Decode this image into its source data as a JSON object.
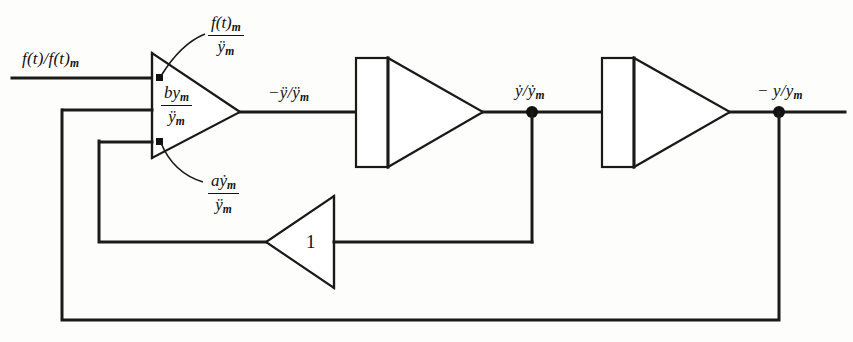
{
  "figure": {
    "type": "analog-computer-block-diagram",
    "stroke_color": "#1a1a1a",
    "background_color": "#fdfdfb"
  },
  "signals": {
    "input": "f(t)/f(t)",
    "input_sub": "m",
    "after_summer": "−ÿ/ÿ",
    "after_summer_sub": "m",
    "after_first_integrator": "ẏ/ẏ",
    "after_first_integrator_sub": "m",
    "output": "− y/y",
    "output_sub": "m"
  },
  "coefficients": [
    {
      "name": "forcing-gain",
      "numerator": "f(t)",
      "numerator_sub": "m",
      "denominator": "ÿ",
      "denominator_sub": "m",
      "target_input": 1
    },
    {
      "name": "position-gain",
      "numerator": "by",
      "numerator_sub": "m",
      "denominator": "ÿ",
      "denominator_sub": "m",
      "target_input": 2
    },
    {
      "name": "velocity-gain",
      "numerator": "aẏ",
      "numerator_sub": "m",
      "denominator": "ÿ",
      "denominator_sub": "m",
      "target_input": 3
    }
  ],
  "blocks": [
    {
      "name": "summing-amplifier",
      "kind": "summer",
      "inputs": 3
    },
    {
      "name": "first-integrator",
      "kind": "integrator"
    },
    {
      "name": "second-integrator",
      "kind": "integrator"
    },
    {
      "name": "inverter-amplifier",
      "kind": "gain",
      "gain_label": "1"
    }
  ],
  "junctions": [
    {
      "name": "velocity-takeoff-node"
    },
    {
      "name": "position-takeoff-node"
    }
  ]
}
